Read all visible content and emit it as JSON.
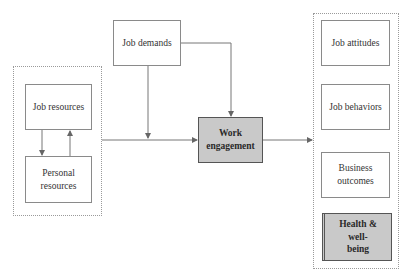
{
  "diagram": {
    "groups": {
      "resources_group": [
        "job_resources",
        "personal_resources"
      ],
      "outcomes_group": [
        "job_attitudes",
        "job_behaviors",
        "business_outcomes",
        "health_well_being"
      ]
    },
    "nodes": {
      "job_demands": "Job demands",
      "job_resources": "Job resources",
      "personal_resources": "Personal resources",
      "work_engagement": "Work engagement",
      "job_attitudes": "Job attitudes",
      "job_behaviors": "Job behaviors",
      "business_outcomes": "Business outcomes",
      "health_well_being": "Health & well-being"
    },
    "edges": [
      {
        "from": "job_demands",
        "to": "work_engagement"
      },
      {
        "from": "job_demands",
        "to": "resources_to_engagement_line"
      },
      {
        "from": "resources_group",
        "to": "work_engagement"
      },
      {
        "from": "job_resources",
        "to": "personal_resources"
      },
      {
        "from": "personal_resources",
        "to": "job_resources"
      },
      {
        "from": "work_engagement",
        "to": "outcomes_group"
      }
    ],
    "colors": {
      "shaded_fill": "#c9c9c9",
      "line": "#777777",
      "border": "#8a8a8a"
    }
  }
}
